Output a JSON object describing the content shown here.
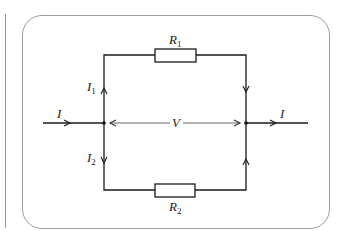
{
  "diagram": {
    "type": "parallel resistor circuit",
    "labels": {
      "input_current": "I",
      "output_current": "I",
      "branch1_current": "I",
      "branch1_current_sub": "1",
      "branch2_current": "I",
      "branch2_current_sub": "2",
      "voltage": "V",
      "resistor1": "R",
      "resistor1_sub": "1",
      "resistor2": "R",
      "resistor2_sub": "2"
    },
    "colors": {
      "wire": "#1a1a1a",
      "frame": "#9c9c9c",
      "voltage_arrow": "#555555"
    }
  }
}
